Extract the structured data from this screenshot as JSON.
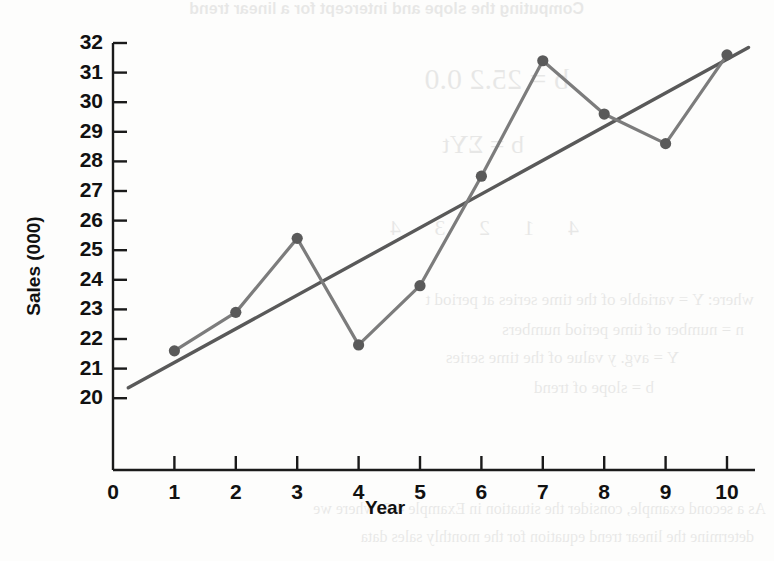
{
  "chart_data": {
    "type": "line",
    "title": "",
    "xlabel": "Year",
    "ylabel": "Sales (000)",
    "xlim": [
      0,
      10.4
    ],
    "ylim": [
      19.4,
      32
    ],
    "xticks": [
      "0",
      "1",
      "2",
      "3",
      "4",
      "5",
      "6",
      "7",
      "8",
      "9",
      "10"
    ],
    "yticks": [
      "20",
      "21",
      "22",
      "23",
      "24",
      "25",
      "26",
      "27",
      "28",
      "29",
      "30",
      "31",
      "32"
    ],
    "grid": false,
    "legend": "none",
    "x": [
      1,
      2,
      3,
      4,
      5,
      6,
      7,
      8,
      9,
      10
    ],
    "series": [
      {
        "name": "Sales",
        "style": "line-with-markers",
        "color": "#7c7c7c",
        "marker_color": "#5a5a5a",
        "values": [
          21.6,
          22.9,
          25.4,
          21.8,
          23.8,
          27.5,
          31.4,
          29.6,
          28.6,
          31.6
        ]
      },
      {
        "name": "Linear trend",
        "style": "straight-line",
        "color": "#595959",
        "x_endpoints": [
          0.25,
          10.35
        ],
        "y_endpoints": [
          20.35,
          31.85
        ]
      }
    ]
  },
  "axes": {
    "y_title": "Sales (000)",
    "x_title": "Year"
  },
  "bleedthrough": {
    "title": "Computing the slope and intercept for a linear trend",
    "eq1": "b = 25.2  0.0",
    "eq2": "b = ΣYt",
    "row": "4   1   2   3   4",
    "line1": "where: Y = variable of the time series at period t",
    "line2": "n = number of time period numbers",
    "line3": "Y = avg. y value of the time series",
    "line4": "b = slope of trend",
    "line5": "As a second example, consider the situation in Example 4-8, where we",
    "line6": "determine the linear trend equation for the monthly sales data"
  }
}
